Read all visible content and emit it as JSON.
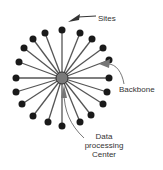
{
  "diagram": {
    "type": "star-topology",
    "labels": {
      "sites": "Sites",
      "backbone": "Backbone",
      "center_line1": "Data",
      "center_line2": "processing",
      "center_line3": "Center"
    },
    "hub": {
      "x": 62,
      "y": 78,
      "r": 6,
      "fill": "#7a7a7a",
      "stroke": "#333333"
    },
    "node_color": "#1a1a1a",
    "spoke_color": "#555555",
    "arrow_color": "#777777",
    "nodes": [
      [
        62,
        30
      ],
      [
        80,
        33
      ],
      [
        92,
        39
      ],
      [
        103,
        48
      ],
      [
        109,
        60
      ],
      [
        109,
        78
      ],
      [
        107,
        92
      ],
      [
        103,
        104
      ],
      [
        91,
        115
      ],
      [
        80,
        122
      ],
      [
        62,
        126
      ],
      [
        48,
        122
      ],
      [
        33,
        116
      ],
      [
        22,
        104
      ],
      [
        16,
        92
      ],
      [
        16,
        78
      ],
      [
        19,
        62
      ],
      [
        24,
        48
      ],
      [
        33,
        39
      ],
      [
        45,
        33
      ]
    ]
  }
}
